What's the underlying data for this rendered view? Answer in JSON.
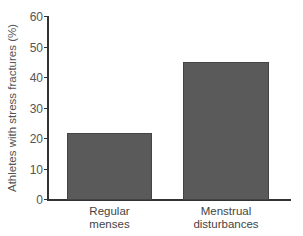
{
  "chart_data": {
    "type": "bar",
    "title": "",
    "xlabel": "",
    "ylabel": "Athletes with stress fractures (%)",
    "categories": [
      "Regular menses",
      "Menstrual disturbances"
    ],
    "category_lines": [
      [
        "Regular",
        "menses"
      ],
      [
        "Menstrual",
        "disturbances"
      ]
    ],
    "values": [
      21.5,
      45
    ],
    "ylim": [
      0,
      60
    ],
    "yticks": [
      0,
      10,
      20,
      30,
      40,
      50,
      60
    ],
    "grid": false,
    "legend": null,
    "bar_color": "#5a5a5a"
  }
}
